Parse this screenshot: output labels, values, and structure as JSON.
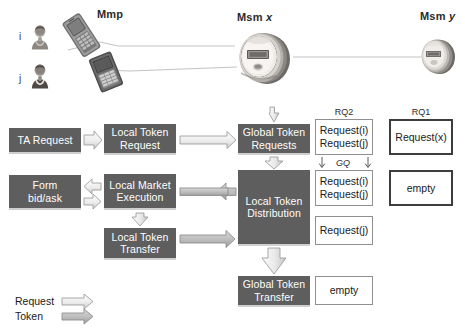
{
  "diagram": {
    "title_visible": false,
    "colors": {
      "box_fill": "#5e5e5e",
      "box_text": "#ffffff",
      "arrow_outline": "#9a9a9a",
      "arrow_fill_light": "#ffffff",
      "arrow_fill_gray": "#b3b3b3",
      "queue_border": "#8f8f8f",
      "queue_border_thick": "#3d3d3d",
      "wire": "#b9b9b9"
    },
    "top_scene": {
      "actors": [
        {
          "id": "i",
          "label": "i",
          "icon": "person-icon"
        },
        {
          "id": "j",
          "label": "j",
          "icon": "person-icon"
        }
      ],
      "devices": [
        {
          "id": "phone-i",
          "icon": "mobile-phone-icon"
        },
        {
          "id": "phone-j",
          "icon": "mobile-phone-icon"
        }
      ],
      "labels": {
        "mmp": "Mmp",
        "msm_x_prefix": "Msm ",
        "msm_x_var": "x",
        "msm_y_prefix": "Msm ",
        "msm_y_var": "y"
      },
      "meters": [
        {
          "id": "msm-x",
          "icon": "electric-meter-icon"
        },
        {
          "id": "msm-y",
          "icon": "electric-meter-icon"
        }
      ]
    },
    "flow_boxes": {
      "ta_request": "TA Request",
      "local_token_request_l1": "Local Token",
      "local_token_request_l2": "Request",
      "form_l1": "Form",
      "form_l2": "bid/ask",
      "local_market_l1": "Local Market",
      "local_market_l2": "Execution",
      "local_token_transfer_l1": "Local Token",
      "local_token_transfer_l2": "Transfer",
      "global_token_requests_l1": "Global Token",
      "global_token_requests_l2": "Requests",
      "local_token_distribution_l1": "Local Token",
      "local_token_distribution_l2": "Distribution",
      "global_token_transfer_l1": "Global Token",
      "global_token_transfer_l2": "Transfer"
    },
    "queues": {
      "rq2_header": "RQ2",
      "rq1_header": "RQ1",
      "gq_label": "GQ",
      "rq2_top_line1": "Request(i)",
      "rq2_top_line2": "Request(j)",
      "rq2_mid_line1": "Request(i)",
      "rq2_mid_line2": "Request(j)",
      "rq2_low_line1": "Request(j)",
      "rq2_bottom_line1": "empty",
      "rq1_top_line1": "Request(x)",
      "rq1_mid_line1": "empty",
      "center_bottom_line1": "empty"
    },
    "legend": {
      "request_label": "Request",
      "token_label": "Token"
    }
  }
}
